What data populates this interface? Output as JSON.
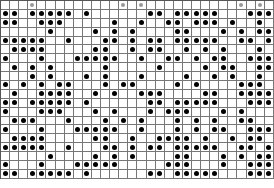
{
  "grid": {
    "columns": 30,
    "rows": 20,
    "legend": {
      "0": "empty",
      "1": "black-dot",
      "2": "gray-dot"
    },
    "cells": [
      "000200000000020200000000002020",
      "110111110100000011011111000111",
      "110011100000100100110111010010",
      "000001000010101000011000101011",
      "111110010001101011011111001101",
      "011110000011001011001010100010",
      "100010001111100100110101100111",
      "010101000001000001000010110011",
      "000101000101000100001001010010",
      "101010110001011000010100001110",
      "010011110010100111000011001111",
      "110111110100000011011111000111",
      "100011100010100010111000101000",
      "011100010001010100010101001100",
      "100010001111100100010101100111",
      "011110000011001001111010010110",
      "111110010001101011011111001101",
      "000001000010101000011000101011",
      "100010001111100000111000100111",
      "110111110100000011011111000111"
    ]
  }
}
